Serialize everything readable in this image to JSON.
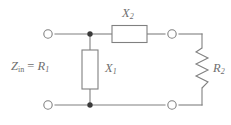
{
  "figure": {
    "type": "circuit-schematic",
    "title": "",
    "width": 231,
    "height": 125,
    "colors": {
      "wire": "#808080",
      "component_stroke": "#808080",
      "component_fill": "#ffffff",
      "label_text": "#6e6e6e",
      "background": "#ffffff",
      "junction_dot": "#3a3a3a"
    }
  },
  "labels": {
    "input_impedance": {
      "base": "Z",
      "sub": "in",
      "equals": " = ",
      "value_base": "R",
      "value_sub": "1"
    },
    "series_reactance": {
      "base": "X",
      "sub": "2"
    },
    "shunt_reactance": {
      "base": "X",
      "sub": "1"
    },
    "load_resistance": {
      "base": "R",
      "sub": "2"
    }
  },
  "components": [
    {
      "name": "series-reactance-x2",
      "symbol": "rectangle-box",
      "label": "X2",
      "orientation": "horizontal"
    },
    {
      "name": "shunt-reactance-x1",
      "symbol": "rectangle-box",
      "label": "X1",
      "orientation": "vertical"
    },
    {
      "name": "load-resistor-r2",
      "symbol": "zigzag-resistor",
      "label": "R2",
      "orientation": "vertical"
    }
  ],
  "terminals": [
    {
      "name": "input-terminal-top",
      "style": "open-circle"
    },
    {
      "name": "input-terminal-bottom",
      "style": "open-circle"
    },
    {
      "name": "output-terminal-top",
      "style": "open-circle"
    },
    {
      "name": "output-terminal-bottom",
      "style": "open-circle"
    }
  ],
  "junctions": [
    {
      "name": "junction-top",
      "style": "filled-dot"
    },
    {
      "name": "junction-bottom",
      "style": "filled-dot"
    }
  ]
}
